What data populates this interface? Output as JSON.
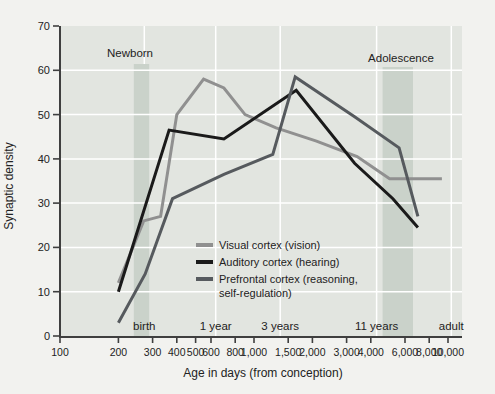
{
  "colors": {
    "page_bg": "#f2f2ef",
    "plot_bg": "#e2e5e0",
    "band": "#cad2ca",
    "grid": "#ffffff",
    "axis": "#3f3f3f",
    "text": "#222222"
  },
  "chart_data": {
    "type": "line",
    "title": "",
    "xlabel": "Age in days (from conception)",
    "ylabel": "Synaptic density",
    "x_scale": "log",
    "xlim": [
      100,
      10000
    ],
    "ylim": [
      0,
      70
    ],
    "grid": true,
    "legend_position": "inside-lower-middle",
    "x_ticks": [
      {
        "label": "100",
        "day": 100
      },
      {
        "label": "200",
        "day": 200
      },
      {
        "label": "300",
        "day": 300
      },
      {
        "label": "400",
        "day": 400
      },
      {
        "label": "500",
        "day": 500
      },
      {
        "label": "600",
        "day": 600
      },
      {
        "label": "800",
        "day": 800
      },
      {
        "label": "1,000",
        "day": 1000
      },
      {
        "label": "1,500",
        "day": 1500
      },
      {
        "label": "2,000",
        "day": 2000
      },
      {
        "label": "3,000",
        "day": 3000
      },
      {
        "label": "4,000",
        "day": 4000
      },
      {
        "label": "6,000",
        "day": 6000
      },
      {
        "label": "8,000",
        "day": 8000
      },
      {
        "label": "10,000",
        "day": 10000
      }
    ],
    "y_ticks": [
      0,
      10,
      20,
      30,
      40,
      50,
      60,
      70
    ],
    "annotations": {
      "newborn": "Newborn",
      "adolescence": "Adolescence"
    },
    "bands": [
      {
        "name": "newborn",
        "from_day": 240,
        "to_day": 288
      },
      {
        "name": "adolescence",
        "from_day": 4600,
        "to_day": 6600
      }
    ],
    "milestones": [
      {
        "label": "birth",
        "day": 272
      },
      {
        "label": "1 year",
        "day": 635
      },
      {
        "label": "3 years",
        "day": 1365
      },
      {
        "label": "11 years",
        "day": 4285
      },
      {
        "label": "adult",
        "day": 10400
      }
    ],
    "series": [
      {
        "name": "Visual cortex (vision)",
        "color": "#909090",
        "points": [
          [
            200,
            12
          ],
          [
            270,
            26
          ],
          [
            330,
            27
          ],
          [
            400,
            50
          ],
          [
            550,
            58
          ],
          [
            700,
            56
          ],
          [
            900,
            50
          ],
          [
            1300,
            47
          ],
          [
            2100,
            44
          ],
          [
            3400,
            40.5
          ],
          [
            5000,
            35.5
          ],
          [
            9300,
            35.5
          ]
        ]
      },
      {
        "name": "Auditory cortex (hearing)",
        "color": "#1a1a1a",
        "points": [
          [
            200,
            10
          ],
          [
            365,
            46.5
          ],
          [
            700,
            44.5
          ],
          [
            1650,
            55.5
          ],
          [
            3300,
            39
          ],
          [
            5200,
            31
          ],
          [
            7000,
            24.5
          ]
        ]
      },
      {
        "name": "Prefrontal cortex (reasoning, self-regulation)",
        "color": "#565a5e",
        "points": [
          [
            200,
            3
          ],
          [
            275,
            14
          ],
          [
            380,
            31
          ],
          [
            700,
            36.5
          ],
          [
            1250,
            41
          ],
          [
            1630,
            58.5
          ],
          [
            3300,
            49.5
          ],
          [
            5600,
            42.5
          ],
          [
            7000,
            27
          ]
        ]
      }
    ],
    "legend": [
      {
        "lines": [
          "Visual cortex (vision)"
        ],
        "color": "#909090"
      },
      {
        "lines": [
          "Auditory cortex (hearing)"
        ],
        "color": "#1a1a1a"
      },
      {
        "lines": [
          "Prefrontal cortex (reasoning,",
          "self-regulation)"
        ],
        "color": "#565a5e"
      }
    ]
  }
}
